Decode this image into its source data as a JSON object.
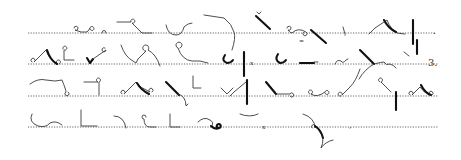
{
  "document": {
    "type": "shorthand-specimen",
    "line_count": 4,
    "ink_color": "#111111",
    "light_ink_color": "#3a3a3a",
    "rule_color": "#555555",
    "background": "#ffffff"
  },
  "lines": [
    {
      "index": 1,
      "y": 33,
      "x_start": 28,
      "x_end": 436,
      "end_mark": "."
    },
    {
      "index": 2,
      "y": 64,
      "x_start": 28,
      "x_end": 438,
      "end_mark": "3."
    },
    {
      "index": 3,
      "y": 96,
      "x_start": 28,
      "x_end": 438,
      "end_mark": ""
    },
    {
      "index": 4,
      "y": 127,
      "x_start": 28,
      "x_end": 438,
      "end_mark": ""
    }
  ],
  "text_marks": [
    {
      "id": "line2-numeral",
      "text": "3.",
      "x": 428,
      "y": 66,
      "size": 10
    },
    {
      "id": "line1-period",
      "text": ".",
      "x": 433,
      "y": 34,
      "size": 9
    },
    {
      "id": "line2-x-mark",
      "text": "x",
      "x": 250,
      "y": 65,
      "size": 6
    },
    {
      "id": "line4-x-mark",
      "text": "x",
      "x": 262,
      "y": 129,
      "size": 6
    },
    {
      "id": "line1-equals-mark",
      "text": "=",
      "x": 299,
      "y": 43,
      "size": 6
    },
    {
      "id": "line4-comma",
      "text": ",",
      "x": 349,
      "y": 128,
      "size": 8
    },
    {
      "id": "line1-comma",
      "text": ",",
      "x": 344,
      "y": 35,
      "size": 7
    }
  ],
  "outlines": [
    {
      "id": "l1-o1",
      "w": "light",
      "d": "M74,28 a2,2 0 1 1 1,2 q6,3 12,2 q2,-2 3,-4 a2,2 0 1 1 0,1"
    },
    {
      "id": "l1-o2",
      "w": "light",
      "d": "M102,33 a2,2.5 0 1 1 4,0"
    },
    {
      "id": "l1-o3",
      "w": "light",
      "d": "M117,22 l14,0 a2,2 0 1 1 1,1 l10,10 l10,0"
    },
    {
      "id": "l1-o4",
      "w": "light",
      "d": "M166,25 q2,10 10,10 q6,0 8,-8 q4,-4 8,-4"
    },
    {
      "id": "l1-o5",
      "w": "light",
      "d": "M204,15 l20,3 q8,6 10,14 q2,6 -2,18"
    },
    {
      "id": "l1-o6",
      "w": "heavy",
      "d": "M256,16 l14,13"
    },
    {
      "id": "l1-o6b",
      "w": "light",
      "d": "M257,12 l2,2 l2,-2"
    },
    {
      "id": "l1-o7",
      "w": "light",
      "d": "M287,28 a2,2 0 1 1 1,2 q2,3 4,3 q6,-6 14,-1 a2,2 0 1 1 -2,0"
    },
    {
      "id": "l1-o7b",
      "w": "heavy",
      "d": "M311,30 l15,13"
    },
    {
      "id": "l1-o8",
      "w": "light",
      "d": "M343,27 l2,7"
    },
    {
      "id": "l1-o9",
      "w": "light",
      "d": "M369,34 l6,-6 l12,-8 q4,10 10,13 l8,1"
    },
    {
      "id": "l1-o9b",
      "w": "heavy",
      "d": "M384,20 q4,8 12,12"
    },
    {
      "id": "l1-o10",
      "w": "heavy",
      "d": "M413,20 l0,24"
    },
    {
      "id": "l1-o10b",
      "w": "heavy",
      "d": "M417,40 l0,14"
    },
    {
      "id": "l2-o1",
      "w": "light",
      "d": "M32,62 a2,2 0 1 1 2,0 l12,-12 q3,10 12,14 a2,2 0 1 1 1,0"
    },
    {
      "id": "l2-o1b",
      "w": "heavy",
      "d": "M47,50 q3,10 10,14"
    },
    {
      "id": "l2-o2",
      "w": "light",
      "d": "M63,49 a2,2 0 1 1 1,1 l0,10 l10,0"
    },
    {
      "id": "l2-o3",
      "w": "heavy",
      "d": "M87,58 l3,5 l3,-4"
    },
    {
      "id": "l2-o3b",
      "w": "light",
      "d": "M93,59 l13,-9 a2,2 0 1 1 -1,-2"
    },
    {
      "id": "l2-o4",
      "w": "light",
      "d": "M121,45 q4,12 12,16 l3,2 l2,-4 l8,-8 a3,3 0 1 1 2,-1 q8,4 12,16"
    },
    {
      "id": "l2-o5",
      "w": "light",
      "d": "M180,48 a3,3 0 1 0 -2,0 q4,12 14,13 q8,-1 16,2"
    },
    {
      "id": "l2-o6",
      "w": "heavy",
      "d": "M225,55 q-4,6 2,8 q4,0 6,-3"
    },
    {
      "id": "l2-o7",
      "w": "heavy",
      "d": "M244,52 l0,24"
    },
    {
      "id": "l2-o8",
      "w": "heavy",
      "d": "M278,54 q-4,6 2,9 q4,0 6,-3"
    },
    {
      "id": "l2-o9",
      "w": "heavy",
      "d": "M300,63 l14,0"
    },
    {
      "id": "l2-o9b",
      "w": "light",
      "d": "M314,62 l4,0"
    },
    {
      "id": "l2-o10",
      "w": "light",
      "d": "M335,64 q2,-5 6,-3 q2,3 5,-1 l2,-1"
    },
    {
      "id": "l2-o11",
      "w": "heavy",
      "d": "M360,50 l14,14"
    },
    {
      "id": "l2-o11b",
      "w": "light",
      "d": "M359,79 q6,-10 15,-15 q8,-2 10,-2 q2,4 6,2 q4,1 6,4"
    },
    {
      "id": "l2-o12",
      "w": "light",
      "d": "M404,52 l5,4"
    },
    {
      "id": "l3-o1",
      "w": "light",
      "d": "M30,84 q8,-6 16,-4 q10,2 16,0 q4,10 4,12 a2,2 0 1 0 2,0"
    },
    {
      "id": "l3-o2",
      "w": "light",
      "d": "M84,82 l14,0 a2,2 0 1 1 1,0 l0,13"
    },
    {
      "id": "l3-o3",
      "w": "light",
      "d": "M122,94 a2,2 0 1 1 2,0 l12,-12 q4,6 14,10 a2,2 0 1 1 2,0"
    },
    {
      "id": "l3-o3b",
      "w": "heavy",
      "d": "M137,83 q4,7 12,11"
    },
    {
      "id": "l3-o4",
      "w": "heavy",
      "d": "M166,82 l13,13"
    },
    {
      "id": "l3-o4b",
      "w": "light",
      "d": "M178,94 q8,2 8,12 l2,-2"
    },
    {
      "id": "l3-o5",
      "w": "light",
      "d": "M193,76 l0,12 l8,0"
    },
    {
      "id": "l3-o6",
      "w": "light",
      "d": "M221,88 l6,6 l6,-6"
    },
    {
      "id": "l3-o7",
      "w": "light",
      "d": "M230,96 l4,-4 l12,-10"
    },
    {
      "id": "l3-o7b",
      "w": "heavy",
      "d": "M247,80 l0,24"
    },
    {
      "id": "l3-o8",
      "w": "heavy",
      "d": "M266,82 l10,12"
    },
    {
      "id": "l3-o8b",
      "w": "light",
      "d": "M276,94 l14,0 a2,2 0 1 1 0,2"
    },
    {
      "id": "l3-o9",
      "w": "light",
      "d": "M310,94 a2,2 0 1 1 1,0 q6,4 14,-2 a2,2 0 1 1 0,1"
    },
    {
      "id": "l3-o10",
      "w": "light",
      "d": "M341,96 a2,2 0 1 1 1,-1 l8,-8 q6,-6 10,-18"
    },
    {
      "id": "l3-o11",
      "w": "light",
      "d": "M380,82 a2,2 0 1 1 1,0 l10,10"
    },
    {
      "id": "l3-o11b",
      "w": "heavy",
      "d": "M396,92 l0,18"
    },
    {
      "id": "l3-o12",
      "w": "light",
      "d": "M410,95 a2,2 0 1 1 2,0 l8,-8 q4,6 10,8 a2,2 0 1 1 2,0"
    },
    {
      "id": "l3-o12b",
      "w": "heavy",
      "d": "M421,85 q4,8 10,10"
    },
    {
      "id": "l4-o1",
      "w": "light",
      "d": "M32,114 q-4,8 6,12 q8,2 12,-3 q6,-3 12,2"
    },
    {
      "id": "l4-o2",
      "w": "light",
      "d": "M81,110 l0,16 l16,0"
    },
    {
      "id": "l4-o3",
      "w": "light",
      "d": "M114,116 q10,0 12,12"
    },
    {
      "id": "l4-o4",
      "w": "light",
      "d": "M146,117 a2,2 0 1 0 -2,2 q0,8 6,8 l6,0"
    },
    {
      "id": "l4-o5",
      "w": "light",
      "d": "M170,114 l0,13 l10,0"
    },
    {
      "id": "l4-o6",
      "w": "light",
      "d": "M198,122 q6,-6 12,-2 q4,2 2,6"
    },
    {
      "id": "l4-o6b",
      "w": "heavy",
      "d": "M211,126 q4,4 8,2 a2,2 0 1 0 -2,-1"
    },
    {
      "id": "l4-o7",
      "w": "light",
      "d": "M240,114 q10,4 18,0"
    },
    {
      "id": "l4-o8",
      "w": "light",
      "d": "M303,114 q12,4 12,14 a2,2 0 1 0 -3,0"
    },
    {
      "id": "l4-o8b",
      "w": "heavy",
      "d": "M315,126 q6,4 8,12"
    },
    {
      "id": "l4-o8c",
      "w": "light",
      "d": "M323,138 q0,6 -2,10 q4,-6 12,-8"
    }
  ]
}
